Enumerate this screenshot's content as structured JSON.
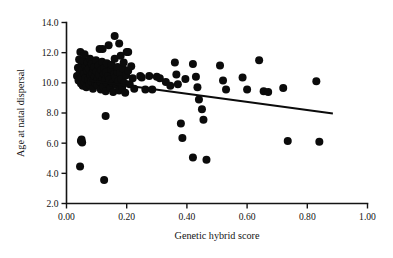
{
  "chart_data": {
    "type": "scatter",
    "title": "",
    "xlabel": "Genetic hybrid score",
    "ylabel": "Age at natal dispersal",
    "xlim": [
      0.0,
      1.0
    ],
    "ylim": [
      2.0,
      14.0
    ],
    "xticks": [
      0.0,
      0.2,
      0.4,
      0.6,
      0.8,
      1.0
    ],
    "xticklabels": [
      "0.00",
      "0.20",
      "0.40",
      "0.60",
      "0.80",
      "1.00"
    ],
    "yticks": [
      2.0,
      4.0,
      6.0,
      8.0,
      10.0,
      12.0,
      14.0
    ],
    "yticklabels": [
      "2.0",
      "4.0",
      "6.0",
      "8.0",
      "10.0",
      "12.0",
      "14.0"
    ],
    "grid": false,
    "legend": null,
    "marker": "filled-circle",
    "marker_color": "#0b0b0b",
    "marker_size_px": 4.6,
    "trendline": {
      "present": true,
      "color": "#0b0b0b",
      "x_start": 0.075,
      "y_start": 10.15,
      "x_end": 0.885,
      "y_end": 7.97
    },
    "points": [
      [
        0.035,
        10.45
      ],
      [
        0.038,
        11.0
      ],
      [
        0.04,
        10.15
      ],
      [
        0.042,
        11.55
      ],
      [
        0.044,
        10.7
      ],
      [
        0.046,
        12.05
      ],
      [
        0.048,
        9.95
      ],
      [
        0.05,
        10.35
      ],
      [
        0.05,
        11.2
      ],
      [
        0.052,
        10.85
      ],
      [
        0.054,
        9.8
      ],
      [
        0.056,
        11.45
      ],
      [
        0.058,
        10.6
      ],
      [
        0.06,
        10.05
      ],
      [
        0.06,
        11.9
      ],
      [
        0.062,
        10.3
      ],
      [
        0.064,
        11.1
      ],
      [
        0.066,
        9.7
      ],
      [
        0.068,
        10.8
      ],
      [
        0.07,
        11.35
      ],
      [
        0.072,
        10.2
      ],
      [
        0.074,
        10.95
      ],
      [
        0.076,
        9.9
      ],
      [
        0.078,
        11.6
      ],
      [
        0.08,
        10.5
      ],
      [
        0.082,
        10.1
      ],
      [
        0.084,
        11.25
      ],
      [
        0.086,
        10.65
      ],
      [
        0.088,
        9.6
      ],
      [
        0.09,
        10.9
      ],
      [
        0.092,
        11.05
      ],
      [
        0.094,
        10.4
      ],
      [
        0.096,
        10.0
      ],
      [
        0.098,
        11.5
      ],
      [
        0.1,
        10.75
      ],
      [
        0.102,
        9.85
      ],
      [
        0.104,
        10.25
      ],
      [
        0.106,
        11.15
      ],
      [
        0.108,
        10.55
      ],
      [
        0.11,
        12.25
      ],
      [
        0.112,
        10.05
      ],
      [
        0.114,
        9.55
      ],
      [
        0.116,
        10.85
      ],
      [
        0.118,
        11.4
      ],
      [
        0.12,
        10.3
      ],
      [
        0.122,
        9.75
      ],
      [
        0.124,
        10.6
      ],
      [
        0.126,
        11.0
      ],
      [
        0.128,
        10.15
      ],
      [
        0.13,
        9.45
      ],
      [
        0.132,
        10.7
      ],
      [
        0.134,
        11.3
      ],
      [
        0.136,
        9.95
      ],
      [
        0.138,
        10.45
      ],
      [
        0.14,
        12.5
      ],
      [
        0.142,
        10.2
      ],
      [
        0.145,
        9.65
      ],
      [
        0.148,
        10.9
      ],
      [
        0.15,
        11.2
      ],
      [
        0.152,
        10.0
      ],
      [
        0.155,
        9.4
      ],
      [
        0.158,
        10.55
      ],
      [
        0.16,
        11.6
      ],
      [
        0.162,
        10.35
      ],
      [
        0.165,
        9.85
      ],
      [
        0.168,
        10.75
      ],
      [
        0.17,
        11.05
      ],
      [
        0.172,
        10.1
      ],
      [
        0.175,
        9.5
      ],
      [
        0.178,
        10.65
      ],
      [
        0.18,
        11.8
      ],
      [
        0.182,
        10.25
      ],
      [
        0.185,
        9.7
      ],
      [
        0.188,
        10.95
      ],
      [
        0.19,
        11.35
      ],
      [
        0.192,
        10.0
      ],
      [
        0.195,
        9.35
      ],
      [
        0.198,
        10.5
      ],
      [
        0.2,
        12.05
      ],
      [
        0.205,
        10.8
      ],
      [
        0.21,
        9.9
      ],
      [
        0.215,
        11.1
      ],
      [
        0.22,
        10.3
      ],
      [
        0.225,
        9.6
      ],
      [
        0.16,
        13.1
      ],
      [
        0.12,
        12.25
      ],
      [
        0.175,
        12.6
      ],
      [
        0.205,
        12.05
      ],
      [
        0.05,
        6.25
      ],
      [
        0.052,
        6.05
      ],
      [
        0.048,
        6.15
      ],
      [
        0.045,
        4.45
      ],
      [
        0.125,
        3.55
      ],
      [
        0.13,
        7.8
      ],
      [
        0.245,
        10.45
      ],
      [
        0.25,
        10.35
      ],
      [
        0.262,
        9.55
      ],
      [
        0.275,
        10.45
      ],
      [
        0.285,
        9.55
      ],
      [
        0.3,
        10.4
      ],
      [
        0.31,
        10.3
      ],
      [
        0.33,
        10.05
      ],
      [
        0.345,
        9.8
      ],
      [
        0.36,
        11.35
      ],
      [
        0.365,
        10.55
      ],
      [
        0.37,
        9.9
      ],
      [
        0.38,
        7.3
      ],
      [
        0.385,
        6.35
      ],
      [
        0.395,
        10.25
      ],
      [
        0.42,
        11.25
      ],
      [
        0.43,
        10.4
      ],
      [
        0.435,
        9.7
      ],
      [
        0.44,
        8.9
      ],
      [
        0.45,
        8.25
      ],
      [
        0.455,
        7.55
      ],
      [
        0.42,
        5.05
      ],
      [
        0.465,
        4.9
      ],
      [
        0.51,
        11.15
      ],
      [
        0.52,
        10.15
      ],
      [
        0.53,
        9.55
      ],
      [
        0.585,
        10.35
      ],
      [
        0.6,
        9.55
      ],
      [
        0.64,
        11.5
      ],
      [
        0.655,
        9.45
      ],
      [
        0.67,
        9.4
      ],
      [
        0.72,
        9.65
      ],
      [
        0.735,
        6.15
      ],
      [
        0.83,
        10.1
      ],
      [
        0.84,
        6.1
      ]
    ]
  },
  "axis_titles": {
    "x": "Genetic hybrid score",
    "y": "Age at natal dispersal"
  }
}
